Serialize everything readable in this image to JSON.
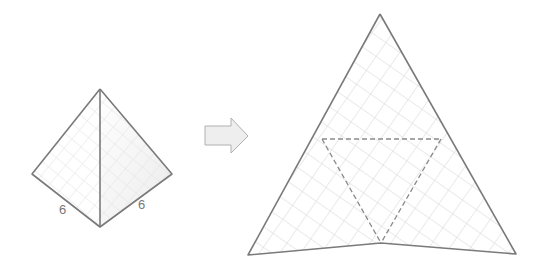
{
  "diagram": {
    "tetrahedron": {
      "edge_labels": [
        {
          "text": "6",
          "position": "left-bottom-edge"
        },
        {
          "text": "6",
          "position": "right-bottom-edge"
        }
      ]
    },
    "arrow": {
      "direction": "right"
    },
    "net": {
      "shape": "large triangle subdivided into 4 triangular faces",
      "fold_lines": "dashed"
    },
    "colors": {
      "edge": "#7a7a7a",
      "grid": "#d6d6d6",
      "arrow_fill": "#eeeeee",
      "arrow_stroke": "#b0b0b0",
      "label": "#777777"
    }
  }
}
